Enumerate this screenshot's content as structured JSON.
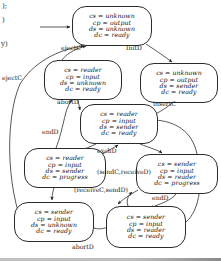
{
  "figure": {
    "type": "state-transition-diagram",
    "margin_notes": [
      {
        "id": "note-1",
        "text": ");",
        "x": 2,
        "y": 2
      },
      {
        "id": "note-2",
        "text": ")",
        "x": 2,
        "y": 16
      },
      {
        "id": "note-3",
        "text": "y)",
        "x": 1,
        "y": 40
      }
    ],
    "nodes": [
      {
        "id": "s0",
        "name": "state-unknown-output-unknown-ready",
        "x": 72,
        "y": 6,
        "w": 80,
        "h": 40,
        "lines": [
          "cs = unknown",
          "cp = output",
          "ds = unknown",
          "dc = ready"
        ]
      },
      {
        "id": "s1",
        "name": "state-reader-input-unknown-ready",
        "x": 44,
        "y": 60,
        "w": 78,
        "h": 40,
        "lines": [
          "cs = reader",
          "cp = input",
          "ds = unknown",
          "dc = ready"
        ]
      },
      {
        "id": "s2",
        "name": "state-unknown-output-sender-ready",
        "x": 140,
        "y": 63,
        "w": 78,
        "h": 40,
        "lines": [
          "cs = unknown",
          "cp = output",
          "ds = sender",
          "dc = ready"
        ]
      },
      {
        "id": "s3",
        "name": "state-reader-input-sender-ready",
        "x": 80,
        "y": 104,
        "w": 78,
        "h": 40,
        "lines": [
          "cs = reader",
          "cp = input",
          "ds = sender",
          "dc = ready"
        ]
      },
      {
        "id": "s4",
        "name": "state-reader-input-sender-progress",
        "x": 24,
        "y": 148,
        "w": 82,
        "h": 40,
        "lines": [
          "cs = reader",
          "cp = input",
          "ds = sender",
          "dc = progress"
        ]
      },
      {
        "id": "s5",
        "name": "state-sender-input-reader-progress",
        "x": 136,
        "y": 154,
        "w": 82,
        "h": 40,
        "lines": [
          "cs = sender",
          "cp = input",
          "ds = reader",
          "dc = progress"
        ]
      },
      {
        "id": "s6",
        "name": "state-sender-input-unknown-ready",
        "x": 14,
        "y": 202,
        "w": 80,
        "h": 40,
        "lines": [
          "cs = sender",
          "cp = input",
          "ds = unknown",
          "dc = ready"
        ]
      },
      {
        "id": "s7",
        "name": "state-sender-input-reader-ready",
        "x": 106,
        "y": 206,
        "w": 80,
        "h": 42,
        "lines": [
          "cs = sender",
          "cp = input",
          "ds = reader",
          "dc = ready"
        ]
      }
    ],
    "edge_labels": [
      {
        "id": "e-ejectc-top",
        "text": "ejectC",
        "x": 61,
        "y": 44
      },
      {
        "id": "e-initd",
        "text": "InitD",
        "x": 126,
        "y": 44
      },
      {
        "id": "e-ejectc-left",
        "text": "ejectC",
        "x": 2,
        "y": 74
      },
      {
        "id": "e-abortd-top",
        "text": "abortD",
        "x": 57,
        "y": 98
      },
      {
        "id": "e-insertc",
        "text": "insertC",
        "x": 153,
        "y": 100
      },
      {
        "id": "e-endd-left",
        "text": "endD",
        "x": 42,
        "y": 128
      },
      {
        "id": "e-exchd",
        "text": "exchD",
        "x": 97,
        "y": 147
      },
      {
        "id": "e-sendc-received",
        "text": "(sendC,receiveD)",
        "x": 97,
        "y": 168
      },
      {
        "id": "e-receivec-sendd",
        "text": "(receiveC,sendD)",
        "x": 74,
        "y": 186
      },
      {
        "id": "e-endd-right",
        "text": "endD",
        "x": 152,
        "y": 194
      },
      {
        "id": "e-abortd-bottom",
        "text": "abortD",
        "x": 72,
        "y": 243
      }
    ],
    "colors": {
      "stroke": "#2b2b2b",
      "text": "#111111",
      "background": "#ffffff"
    }
  }
}
